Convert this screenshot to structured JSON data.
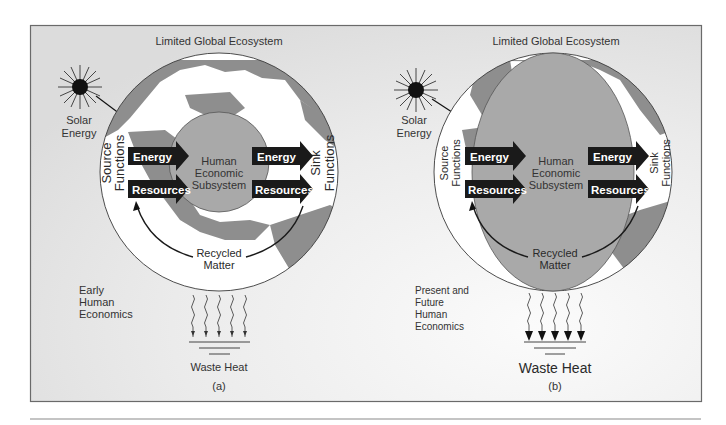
{
  "figure": {
    "panels": [
      {
        "id": "a",
        "title": "Limited Global Ecosystem",
        "solar_label": [
          "Solar",
          "Energy"
        ],
        "source_label": [
          "Source",
          "Functions"
        ],
        "sink_label": [
          "Sink",
          "Functions"
        ],
        "input_arrows": [
          "Energy",
          "Resources"
        ],
        "output_arrows": [
          "Energy",
          "Resources"
        ],
        "center_label": [
          "Human",
          "Economic",
          "Subsystem"
        ],
        "recycled_label": [
          "Recycled",
          "Matter"
        ],
        "era_label": [
          "Early",
          "Human",
          "Economics"
        ],
        "waste_label": "Waste Heat",
        "caption": "(a)"
      },
      {
        "id": "b",
        "title": "Limited Global Ecosystem",
        "solar_label": [
          "Solar",
          "Energy"
        ],
        "source_label": [
          "Source",
          "Functions"
        ],
        "sink_label": [
          "Sink",
          "Functions"
        ],
        "input_arrows": [
          "Energy",
          "Resources"
        ],
        "output_arrows": [
          "Energy",
          "Resources"
        ],
        "center_label": [
          "Human",
          "Economic",
          "Subsystem"
        ],
        "recycled_label": [
          "Recycled",
          "Matter"
        ],
        "era_label": [
          "Present and",
          "Future",
          "Human",
          "Economics"
        ],
        "waste_label": "Waste Heat",
        "caption": "(b)"
      }
    ],
    "colors": {
      "land": "#8e8e8e",
      "ocean": "#ffffff",
      "economy": "#a9a9a9",
      "arrows": "#1a1a1a",
      "background": "#e6e6e6"
    }
  }
}
